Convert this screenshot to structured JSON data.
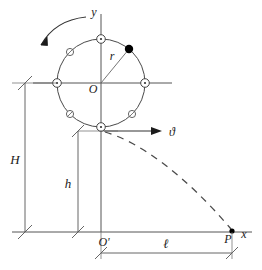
{
  "figure": {
    "type": "physics-diagram",
    "background_color": "#ffffff",
    "line_color": "#3a3a3a",
    "label_color": "#1b1b1b",
    "marker_fill_color": "#000000"
  },
  "axes": {
    "y_label": "y",
    "x_label": "x",
    "origin_ground_label": "O'",
    "circle_center_label": "O"
  },
  "labels": {
    "radius": "r",
    "velocity": "ϑ",
    "height_total": "H",
    "height_lower": "h",
    "distance": "ℓ",
    "landing_point": "P"
  },
  "geometry": {
    "circle_center_x": 101,
    "circle_center_y": 83,
    "circle_radius": 44,
    "ground_y": 232,
    "origin_ground_x": 101,
    "landing_x": 232
  },
  "markers": {
    "ring_markers_deg": [
      90,
      180,
      270,
      0
    ],
    "slashed_markers_deg": [
      135,
      225,
      315
    ],
    "filled_marker_deg": 50
  },
  "annotations": {
    "rotation_direction": "counter-clockwise",
    "trajectory_style": "dashed-parabola"
  }
}
